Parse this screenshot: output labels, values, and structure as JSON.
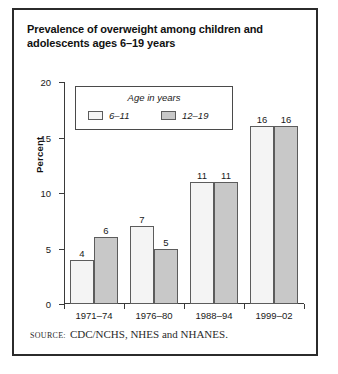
{
  "figure": {
    "title": "Prevalence of overweight among children and adolescents ages 6–19 years",
    "source_label": "SOURCE:",
    "source_text": "CDC/NCHS, NHES and NHANES.",
    "border_color": "#2b2b2b"
  },
  "legend": {
    "title": "Age in years",
    "entries": [
      {
        "label": "6–11",
        "color": "#f4f4f4"
      },
      {
        "label": "12–19",
        "color": "#c8c8c8"
      }
    ]
  },
  "chart_data": {
    "type": "bar",
    "title": "Prevalence of overweight among children and adolescents ages 6–19 years",
    "xlabel": "",
    "ylabel": "Percent",
    "categories": [
      "1971–74",
      "1976–80",
      "1988–94",
      "1999–02"
    ],
    "series": [
      {
        "name": "6–11",
        "values": [
          4,
          7,
          11,
          16
        ],
        "color": "#f4f4f4"
      },
      {
        "name": "12–19",
        "values": [
          6,
          5,
          11,
          16
        ],
        "color": "#c8c8c8"
      }
    ],
    "ylim": [
      0,
      20
    ],
    "yticks": [
      0,
      5,
      10,
      15,
      20
    ],
    "ytick_labels": [
      "0",
      "5",
      "10",
      "15",
      "20"
    ],
    "grid": false,
    "legend_position": "upper-left",
    "data_labels": true
  }
}
